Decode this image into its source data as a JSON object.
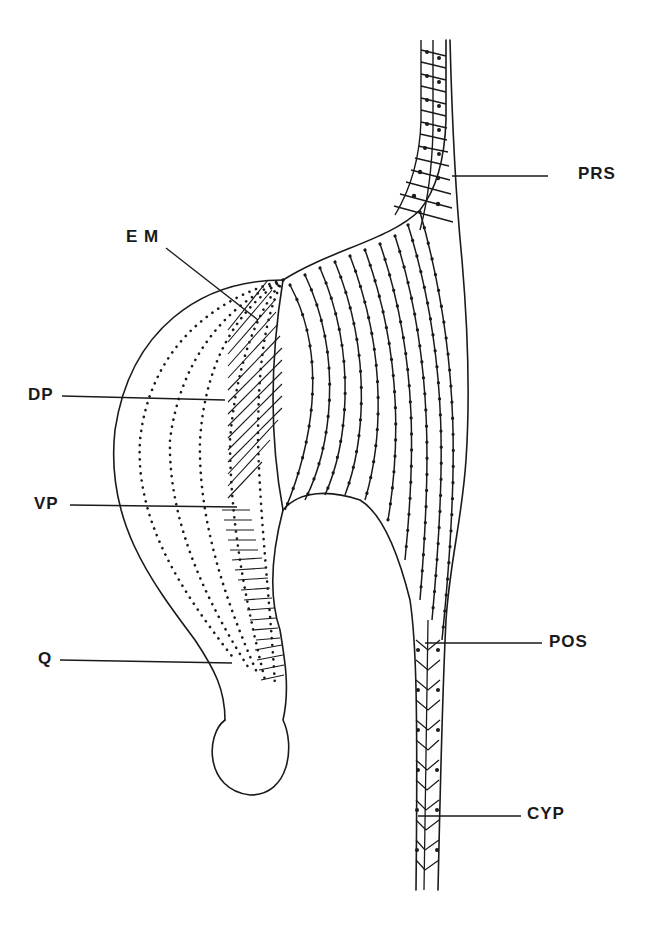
{
  "figure": {
    "type": "anatomical line drawing",
    "ink_color": "#1a1a1a",
    "background": "#ffffff"
  },
  "labels": [
    {
      "id": "PRS",
      "text": "PRS",
      "x": 592,
      "y": 171,
      "line": [
        548,
        176,
        452,
        176
      ]
    },
    {
      "id": "EM",
      "text": "E M",
      "x": 126,
      "y": 227,
      "line": [
        166,
        248,
        258,
        320
      ]
    },
    {
      "id": "DP",
      "text": "DP",
      "x": 28,
      "y": 377,
      "line": [
        62,
        396,
        225,
        400
      ]
    },
    {
      "id": "VP",
      "text": "VP",
      "x": 36,
      "y": 493,
      "line": [
        70,
        505,
        237,
        507
      ]
    },
    {
      "id": "Q",
      "text": "Q",
      "x": 38,
      "y": 645,
      "line": [
        60,
        660,
        232,
        663
      ]
    },
    {
      "id": "POS",
      "text": "POS",
      "x": 549,
      "y": 633,
      "line": [
        542,
        643,
        425,
        643
      ]
    },
    {
      "id": "CYP",
      "text": "CYP",
      "x": 527,
      "y": 802,
      "line": [
        521,
        816,
        418,
        816
      ]
    }
  ]
}
